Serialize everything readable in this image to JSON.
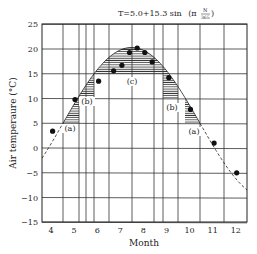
{
  "chart_data": {
    "type": "line",
    "title_parts": {
      "lhs": "T=5.0+15.3 sin",
      "open": "(π",
      "num": "N",
      "den": "365",
      "close": ")"
    },
    "xlabel": "Month",
    "ylabel": "Air temperaure (°C)",
    "xlim": [
      3.6,
      12.5
    ],
    "ylim": [
      -15,
      25
    ],
    "xticks": [
      4,
      5,
      6,
      7,
      8,
      9,
      10,
      11,
      12
    ],
    "yticks": [
      25,
      20,
      15,
      10,
      5,
      0,
      -5,
      -10,
      -15
    ],
    "ytick_labels": [
      "25",
      "20",
      "15",
      "10",
      "5",
      "0",
      "−5",
      "−10",
      "−15"
    ],
    "grid": true,
    "series": [
      {
        "name": "Observed air temperature",
        "kind": "scatter",
        "points": [
          {
            "month": 4.07,
            "T": 3.4
          },
          {
            "month": 5.04,
            "T": 9.8
          },
          {
            "month": 6.06,
            "T": 13.5
          },
          {
            "month": 6.71,
            "T": 15.6
          },
          {
            "month": 7.07,
            "T": 16.7
          },
          {
            "month": 7.4,
            "T": 19.3
          },
          {
            "month": 7.73,
            "T": 20.2
          },
          {
            "month": 8.06,
            "T": 19.3
          },
          {
            "month": 8.38,
            "T": 17.4
          },
          {
            "month": 9.1,
            "T": 14.2
          },
          {
            "month": 10.04,
            "T": 7.8
          },
          {
            "month": 11.06,
            "T": 1.0
          },
          {
            "month": 12.04,
            "T": -5.0
          }
        ]
      },
      {
        "name": "Fitted sine curve",
        "kind": "line",
        "formula": "T=5.0+15.3 sin (π N/365)",
        "peak": {
          "month": 7.6,
          "T": 20.3
        },
        "zero_crossings_T5": [
          4.6,
          10.5
        ]
      }
    ],
    "shaded_regions": [
      {
        "label": "(a)",
        "side": "left",
        "month_range": [
          4.52,
          5.22
        ],
        "T_floor": 5
      },
      {
        "label": "(b)",
        "side": "left",
        "month_range": [
          5.22,
          5.87
        ],
        "T_floor": 10
      },
      {
        "label": "(c)",
        "side": "center",
        "month_range": [
          5.87,
          8.86
        ],
        "T_floor": 15
      },
      {
        "label": "(b)",
        "side": "right",
        "month_range": [
          8.86,
          9.35
        ],
        "T_floor": 10
      },
      {
        "label": "(a)",
        "side": "right",
        "month_range": [
          9.65,
          10.5
        ],
        "T_floor": 5
      }
    ],
    "annotations": [
      "(a)",
      "(b)",
      "(c)",
      "(b)",
      "(a)"
    ]
  }
}
